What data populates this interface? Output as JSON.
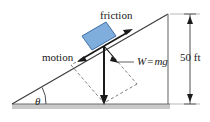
{
  "figure": {
    "background_color": "#ffffff",
    "line_color": "#3a3a3a",
    "block_color": "#7FAEDC",
    "block_edge_color": "#3f6ea8",
    "ground_color": "#c9c9c9",
    "width": 210,
    "height": 122
  },
  "labels": {
    "friction": "friction",
    "motion": "motion",
    "weight_symbol": "W",
    "weight_equals": "=",
    "weight_expression": "mg",
    "height": "50 ft",
    "angle": "θ"
  },
  "geometry": {
    "incline_apex": [
      168,
      14
    ],
    "incline_base_left": [
      12,
      104
    ],
    "incline_base_right": [
      168,
      104
    ],
    "block_center": [
      95,
      42
    ],
    "weight_tail": [
      104,
      46
    ],
    "weight_head": [
      104,
      103
    ],
    "dimension_x": 190,
    "dimension_top": 14,
    "dimension_bottom": 104
  },
  "vectors": [
    {
      "name": "friction",
      "direction": "up-the-incline",
      "label": "friction"
    },
    {
      "name": "motion",
      "direction": "down-the-incline",
      "label": "motion"
    },
    {
      "name": "weight",
      "direction": "vertically-down",
      "label": "W = mg"
    },
    {
      "name": "normal-component",
      "direction": "perpendicular-into-incline",
      "label": ""
    }
  ],
  "dimension": {
    "value": "50 ft",
    "measures": "vertical height of incline"
  }
}
